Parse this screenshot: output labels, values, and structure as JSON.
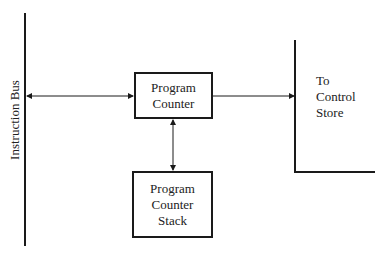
{
  "diagram": {
    "bus_label": "Instruction Bus",
    "program_counter": {
      "line1": "Program",
      "line2": "Counter"
    },
    "program_counter_stack": {
      "line1": "Program",
      "line2": "Counter",
      "line3": "Stack"
    },
    "control_store": {
      "line1": "To",
      "line2": "Control",
      "line3": "Store"
    },
    "connections": [
      {
        "from": "Instruction Bus",
        "to": "Program Counter",
        "type": "bidirectional"
      },
      {
        "from": "Program Counter",
        "to": "Program Counter Stack",
        "type": "bidirectional"
      },
      {
        "from": "Program Counter",
        "to": "Control Store",
        "type": "unidirectional"
      }
    ]
  }
}
